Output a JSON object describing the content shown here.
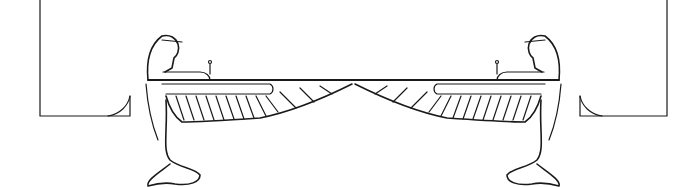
{
  "illustration": {
    "description": "Line-art drawing of two kneeling winged Egyptian goddess figures facing each other, wings outstretched meeting at center, flanked by bracket shapes",
    "colors": {
      "stroke": "#1a1a1a",
      "background": "#ffffff"
    },
    "elements": [
      "left-bracket",
      "left-winged-figure",
      "right-winged-figure",
      "right-bracket"
    ]
  }
}
